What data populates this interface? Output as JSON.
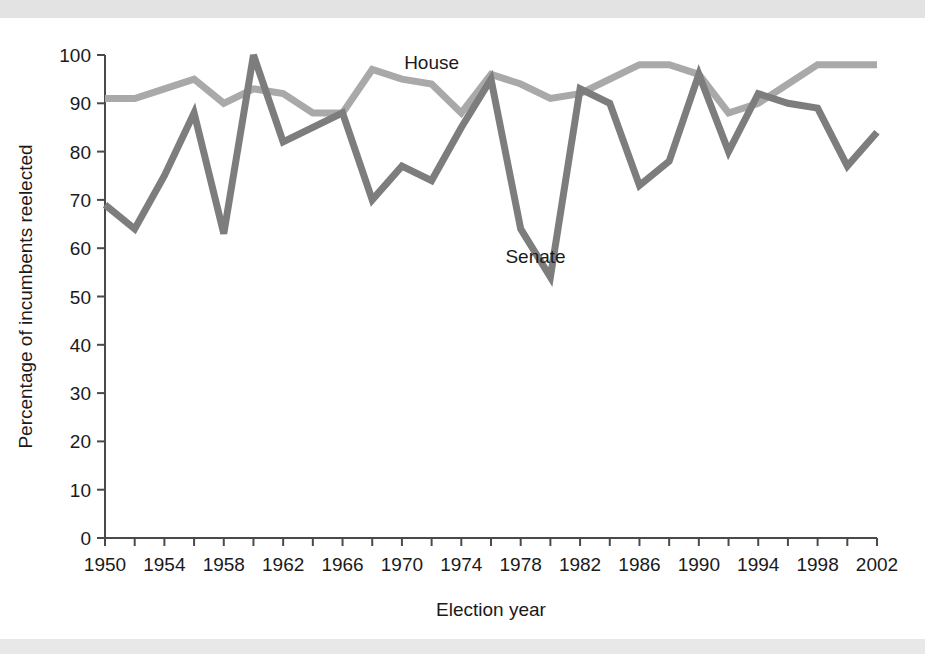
{
  "figure": {
    "background_color": "#ffffff",
    "band_color": "#e3e3e3"
  },
  "chart_data": {
    "type": "line",
    "title": "",
    "subtitle": "",
    "xlabel": "Election year",
    "ylabel": "Percentage of incumbents reelected",
    "xlim": [
      1950,
      2002
    ],
    "ylim": [
      0,
      100
    ],
    "grid": false,
    "legend_position": "inline-annotations",
    "x_tick_step_minor": 2,
    "x_tick_step_major": 4,
    "y_tick_step": 10,
    "x": [
      1950,
      1952,
      1954,
      1956,
      1958,
      1960,
      1962,
      1964,
      1966,
      1968,
      1970,
      1972,
      1974,
      1976,
      1978,
      1980,
      1982,
      1984,
      1986,
      1988,
      1990,
      1992,
      1994,
      1996,
      1998,
      2000,
      2002
    ],
    "x_tick_labels": [
      "1950",
      "1954",
      "1958",
      "1962",
      "1966",
      "1970",
      "1974",
      "1978",
      "1982",
      "1986",
      "1990",
      "1994",
      "1998",
      "2002"
    ],
    "x_tick_values": [
      1950,
      1954,
      1958,
      1962,
      1966,
      1970,
      1974,
      1978,
      1982,
      1986,
      1990,
      1994,
      1998,
      2002
    ],
    "y_tick_labels": [
      "0",
      "10",
      "20",
      "30",
      "40",
      "50",
      "60",
      "70",
      "80",
      "90",
      "100"
    ],
    "y_tick_values": [
      0,
      10,
      20,
      30,
      40,
      50,
      60,
      70,
      80,
      90,
      100
    ],
    "series": [
      {
        "name": "House",
        "color": "#a9a9a9",
        "label": "House",
        "label_x": 1972,
        "label_y": 97,
        "values": [
          91,
          91,
          93,
          95,
          90,
          93,
          92,
          88,
          88,
          97,
          95,
          94,
          88,
          96,
          94,
          91,
          92,
          95,
          98,
          98,
          96,
          88,
          90,
          94,
          98,
          98,
          98
        ]
      },
      {
        "name": "Senate",
        "color": "#7d7d7d",
        "label": "Senate",
        "label_x": 1979,
        "label_y": 57,
        "values": [
          69,
          64,
          75,
          88,
          63,
          100,
          82,
          85,
          88,
          70,
          77,
          74,
          85,
          95,
          64,
          54,
          93,
          90,
          73,
          78,
          96,
          80,
          92,
          90,
          89,
          77,
          84
        ]
      }
    ]
  },
  "axis": {
    "x_title": "Election year",
    "y_title": "Percentage of incumbents reelected"
  }
}
